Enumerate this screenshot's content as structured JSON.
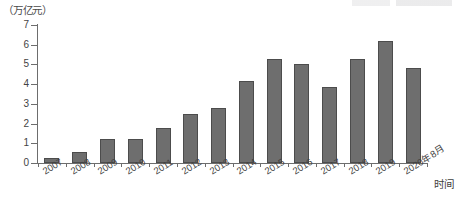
{
  "chart_data": {
    "type": "bar",
    "title": "",
    "subtitle": "",
    "ylabel": "（万亿元）",
    "xlabel": "时间",
    "ylim": [
      0,
      7
    ],
    "yticks": [
      0,
      1,
      2,
      3,
      4,
      5,
      6,
      7
    ],
    "ytick_labels": [
      "0",
      "1",
      "2",
      "3",
      "4",
      "5",
      "6",
      "7"
    ],
    "grid": false,
    "legend": null,
    "bar_color": "#6e6e6e",
    "bar_edge_color": "#4c4c4c",
    "axis_color": "#6d6d6d",
    "categories": [
      "2007",
      "2008",
      "2009",
      "2010",
      "2011",
      "2012",
      "2013",
      "2014",
      "2015",
      "2016",
      "2017",
      "2018",
      "2019",
      "2020年8月"
    ],
    "values": [
      0.25,
      0.55,
      1.2,
      1.2,
      1.8,
      2.5,
      2.8,
      4.15,
      5.3,
      5.0,
      3.85,
      5.3,
      6.2,
      4.8
    ]
  },
  "axis": {
    "y_title": "（万亿元）",
    "x_title": "时间"
  }
}
